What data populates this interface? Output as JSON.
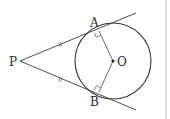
{
  "figure": {
    "type": "geometry",
    "labels": {
      "P": "P",
      "A": "A",
      "B": "B",
      "O": "O"
    },
    "points": {
      "P": [
        20,
        61
      ],
      "A": [
        99,
        31
      ],
      "B": [
        99,
        92
      ],
      "O": [
        113,
        61
      ]
    },
    "circle": {
      "center": "O",
      "radius": 38
    },
    "marks": {
      "equal_tangent_ticks": [
        "PA",
        "PB"
      ],
      "right_angles": [
        "OAP",
        "OBP"
      ]
    },
    "colors": {
      "line": "#3a3a3a",
      "border": "#cfcfcf"
    }
  }
}
